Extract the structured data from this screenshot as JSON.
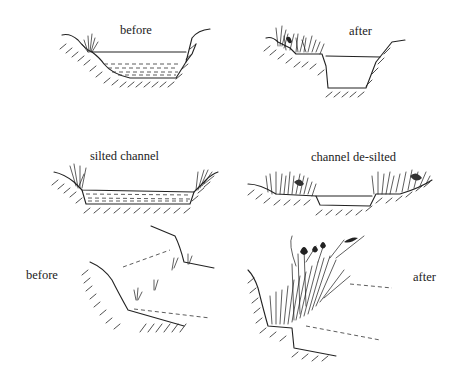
{
  "figure": {
    "panels": [
      {
        "id": "top-left",
        "label": "before"
      },
      {
        "id": "top-right",
        "label": "after"
      },
      {
        "id": "middle-left",
        "label": "silted channel"
      },
      {
        "id": "middle-right",
        "label": "channel de-silted"
      },
      {
        "id": "bottom-left",
        "label": "before"
      },
      {
        "id": "bottom-right",
        "label": "after"
      }
    ]
  }
}
